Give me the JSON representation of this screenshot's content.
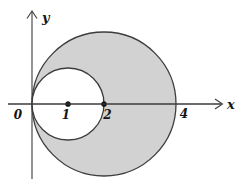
{
  "figure": {
    "background": "#ffffff",
    "colors": {
      "shade": "#d2d2d2",
      "outline": "#3d3d3d",
      "axis": "#3d3d3d",
      "text": "#141414",
      "dot": "#141414"
    },
    "axes": {
      "x_label": "x",
      "y_label": "y",
      "origin_label": "0"
    },
    "circles": [
      {
        "name": "outer-shaded-circle",
        "cx": 2,
        "cy": 0,
        "r": 2,
        "fill": "shade"
      },
      {
        "name": "inner-white-circle",
        "cx": 1,
        "cy": 0,
        "r": 1,
        "fill": "background"
      }
    ],
    "points": [
      {
        "x": 1,
        "y": 0
      },
      {
        "x": 2,
        "y": 0
      }
    ],
    "tick_labels": [
      {
        "text": "1",
        "x": 1
      },
      {
        "text": "2",
        "x": 2
      },
      {
        "text": "4",
        "x": 4
      }
    ]
  }
}
